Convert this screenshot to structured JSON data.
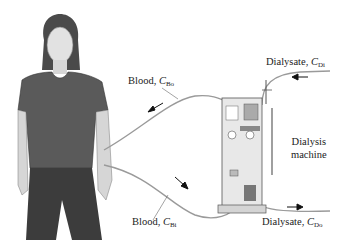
{
  "diagram": {
    "labels": {
      "blood_out": {
        "text": "Blood, ",
        "var": "C",
        "sub": "Bo"
      },
      "blood_in": {
        "text": "Blood, ",
        "var": "C",
        "sub": "Bi"
      },
      "dialysate_in": {
        "text": "Dialysate, ",
        "var": "C",
        "sub": "Di"
      },
      "dialysate_out": {
        "text": "Dialysate, ",
        "var": "C",
        "sub": "Do"
      },
      "machine_line1": "Dialysis",
      "machine_line2": "machine"
    },
    "colors": {
      "tube": "#9a9a9a",
      "shirt": "#5a5a5a",
      "pants": "#3c3c3c",
      "skin": "#d9d9d9",
      "hair": "#4a4a4a",
      "machine": "#e6e6e6",
      "text": "#222222"
    }
  }
}
